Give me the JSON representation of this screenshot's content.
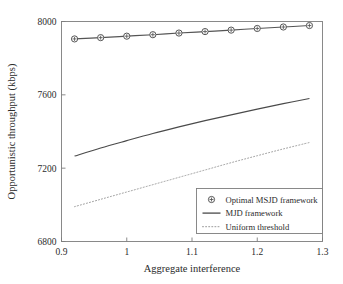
{
  "chart_data": {
    "type": "line",
    "title": "",
    "xlabel": "Aggregate interference",
    "ylabel": "Opportunistic throughput (kbps)",
    "xlim": [
      0.9,
      1.3
    ],
    "ylim": [
      6800,
      8000
    ],
    "xticks": [
      0.9,
      1.0,
      1.1,
      1.2,
      1.3
    ],
    "xticklabels": [
      "0.9",
      "1",
      "1.1",
      "1.2",
      "1.3"
    ],
    "yticks": [
      6800,
      7200,
      7600,
      8000
    ],
    "yticklabels": [
      "6800",
      "7200",
      "7600",
      "8000"
    ],
    "grid": false,
    "legend_position": "lower right",
    "series": [
      {
        "name": "Optimal MSJD framework",
        "style": "solid-with-markers",
        "marker": "circle-plus",
        "color": "#555555",
        "x": [
          0.92,
          0.96,
          1.0,
          1.04,
          1.08,
          1.12,
          1.16,
          1.2,
          1.24,
          1.28
        ],
        "y": [
          7905,
          7912,
          7920,
          7928,
          7937,
          7945,
          7953,
          7962,
          7970,
          7978
        ]
      },
      {
        "name": "MJD framework",
        "style": "solid",
        "color": "#4a4a4a",
        "x": [
          0.92,
          0.96,
          1.0,
          1.04,
          1.08,
          1.12,
          1.16,
          1.2,
          1.24,
          1.28
        ],
        "y": [
          7266,
          7310,
          7350,
          7389,
          7425,
          7459,
          7491,
          7522,
          7552,
          7580
        ]
      },
      {
        "name": "Uniform threshold",
        "style": "dotted",
        "color": "#9a9a9a",
        "x": [
          0.92,
          0.96,
          1.0,
          1.04,
          1.08,
          1.12,
          1.16,
          1.2,
          1.24,
          1.28
        ],
        "y": [
          6990,
          7030,
          7070,
          7110,
          7150,
          7190,
          7230,
          7268,
          7305,
          7340
        ]
      }
    ]
  },
  "legend": {
    "items": [
      {
        "label": "Optimal MSJD framework",
        "marker": "circle-plus",
        "style": "solid-with-markers"
      },
      {
        "label": "MJD framework",
        "marker": "none",
        "style": "solid"
      },
      {
        "label": "Uniform threshold",
        "marker": "none",
        "style": "dotted"
      }
    ]
  },
  "colors": {
    "axis": "#7d7d7d",
    "text": "#2b2b2b",
    "series_1": "#555555",
    "series_2": "#4a4a4a",
    "series_3": "#9a9a9a",
    "background": "#ffffff"
  }
}
